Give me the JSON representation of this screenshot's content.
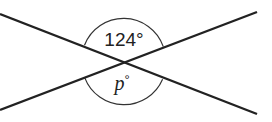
{
  "diagram": {
    "type": "intersecting-lines-angles",
    "lines": [
      {
        "name": "line-a",
        "from": [
          0,
          14
        ],
        "to": [
          257,
          114
        ]
      },
      {
        "name": "line-b",
        "from": [
          0,
          110
        ],
        "to": [
          257,
          12
        ]
      }
    ],
    "intersection": [
      123,
      62
    ],
    "angles": {
      "top": {
        "label": "124°",
        "value": 124
      },
      "bottom": {
        "label_var": "p",
        "label_deg": "°"
      }
    },
    "colors": {
      "line": "#222222",
      "background": "#ffffff"
    }
  }
}
